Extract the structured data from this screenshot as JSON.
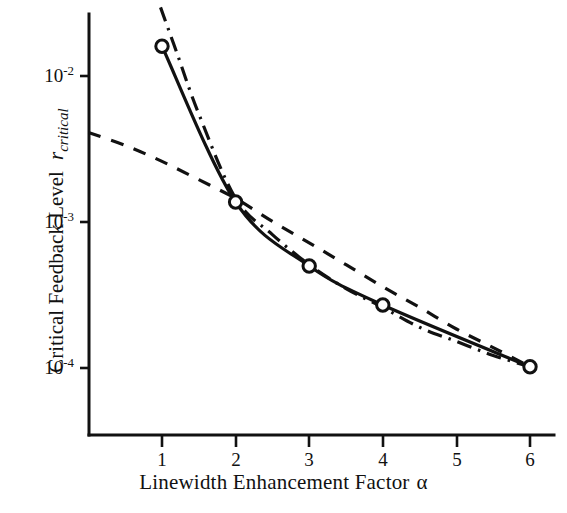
{
  "chart_data": {
    "type": "line",
    "title": "",
    "xlabel": "Linewidth Enhancement Factor  α",
    "ylabel": "Critical Feedback Level   r_critical",
    "ylabel_text": "Critical Feedback Level",
    "ylabel_symbol": "r",
    "ylabel_symbol_sub": "critical",
    "xlabel_text": "Linewidth Enhancement Factor",
    "xlabel_symbol": "α",
    "x_scale": "linear",
    "y_scale": "log",
    "xlim": [
      0.0,
      6.6
    ],
    "ylim": [
      3e-05,
      0.03
    ],
    "grid": false,
    "legend": "none",
    "xticks": [
      1,
      2,
      3,
      4,
      5,
      6
    ],
    "xtick_labels": [
      "1",
      "2",
      "3",
      "4",
      "5",
      "6"
    ],
    "yticks": [
      0.01,
      0.001,
      0.0001
    ],
    "ytick_labels": [
      "10-2",
      "10-3",
      "10-4"
    ],
    "ytick_mantissa": "10",
    "ytick_exponents": [
      "-2",
      "-3",
      "-4"
    ],
    "series": [
      {
        "name": "solid-with-markers",
        "style": "solid",
        "marker": "open-circle",
        "x": [
          1,
          2,
          3,
          4,
          6
        ],
        "values": [
          0.016,
          0.00137,
          0.0005,
          0.00027,
          0.000102
        ]
      },
      {
        "name": "dash-dot-asymptote",
        "style": "dash-dot",
        "marker": "none",
        "x": [
          0.98,
          1.2,
          1.5,
          2.0,
          2.5,
          3.0,
          3.5,
          4.0,
          4.5,
          5.0,
          5.5,
          6.0
        ],
        "values": [
          0.0295,
          0.0145,
          0.0055,
          0.00145,
          0.00082,
          0.00051,
          0.00035,
          0.00026,
          0.00019,
          0.000152,
          0.000122,
          0.000102
        ]
      },
      {
        "name": "dashed-approximation",
        "style": "dashed",
        "marker": "none",
        "x": [
          0.0,
          0.5,
          1.0,
          1.5,
          2.0,
          2.5,
          3.0,
          3.5,
          4.0,
          4.5,
          5.0,
          5.5,
          6.0
        ],
        "values": [
          0.0041,
          0.00335,
          0.0026,
          0.00195,
          0.00145,
          0.00101,
          0.00072,
          0.00051,
          0.00036,
          0.00026,
          0.000185,
          0.000138,
          0.000102
        ]
      }
    ],
    "marker_points": [
      {
        "x": 1,
        "y": 0.016
      },
      {
        "x": 2,
        "y": 0.00137
      },
      {
        "x": 3,
        "y": 0.0005
      },
      {
        "x": 4,
        "y": 0.00027
      },
      {
        "x": 6,
        "y": 0.000102
      }
    ],
    "colors": {
      "line": "#111111",
      "axis": "#111111",
      "marker_face": "#ffffff",
      "background": "#ffffff"
    }
  }
}
